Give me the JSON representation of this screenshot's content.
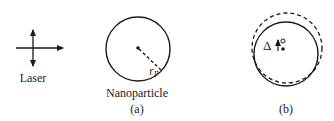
{
  "diagram": {
    "laser": {
      "label": "Laser"
    },
    "panel_a": {
      "label": "Nanoparticle",
      "caption": "(a)",
      "radius_label_main": "r",
      "radius_label_sub": "p"
    },
    "panel_b": {
      "caption": "(b)",
      "delta_symbol": "Δ"
    },
    "colors": {
      "stroke": "#1a1a1a",
      "background": "#ffffff"
    }
  }
}
